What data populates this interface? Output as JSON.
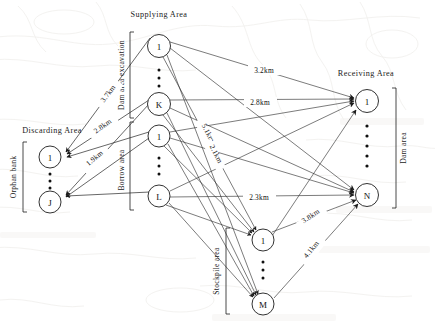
{
  "figure": {
    "type": "network-diagram"
  },
  "groups": {
    "supplying": {
      "title": "Supplying Area",
      "subgroups": [
        {
          "side_label": "Dam area excavation",
          "nodes": [
            "1",
            "K"
          ]
        },
        {
          "side_label": "Borrow area",
          "nodes": [
            "1",
            "L"
          ]
        }
      ]
    },
    "discarding": {
      "title": "Discarding Area",
      "side_label": "Orphan bank",
      "nodes": [
        "1",
        "J"
      ]
    },
    "receiving": {
      "title": "Receiving Area",
      "side_label": "Dam area",
      "nodes": [
        "1",
        "N"
      ]
    },
    "stockpile": {
      "side_label": "Stockpile area",
      "nodes": [
        "1",
        "M"
      ]
    }
  },
  "distances": {
    "unit": "km",
    "edges": [
      {
        "id": "d37",
        "label": "3.7km",
        "from": "supply-dam-1",
        "to": "discard-1"
      },
      {
        "id": "d28l",
        "label": "2.8km",
        "from": "supply-dam-K",
        "to": "discard-1"
      },
      {
        "id": "d19",
        "label": "1.9km",
        "from": "supply-borrow-1",
        "to": "discard-J"
      },
      {
        "id": "d32",
        "label": "3.2km",
        "from": "supply-dam-1",
        "to": "receive-1"
      },
      {
        "id": "d28r",
        "label": "2.8km",
        "from": "supply-dam-K",
        "to": "receive-1"
      },
      {
        "id": "d51",
        "label": "5.1km",
        "from": "supply-dam-1",
        "to": "stockpile-M"
      },
      {
        "id": "d21",
        "label": "2.1km",
        "from": "supply-dam-K",
        "to": "stockpile-1"
      },
      {
        "id": "d23",
        "label": "2.3km",
        "from": "supply-borrow-L",
        "to": "receive-N"
      },
      {
        "id": "d38",
        "label": "3.8km",
        "from": "stockpile-1",
        "to": "receive-N"
      },
      {
        "id": "d41",
        "label": "4.1km",
        "from": "stockpile-M",
        "to": "receive-N"
      }
    ]
  },
  "nodes": {
    "supply_dam_1": "1",
    "supply_dam_K": "K",
    "supply_borrow_1": "1",
    "supply_borrow_L": "L",
    "discard_1": "1",
    "discard_J": "J",
    "receive_1": "1",
    "receive_N": "N",
    "stockpile_1": "1",
    "stockpile_M": "M"
  },
  "colors": {
    "line": "#2b2b2b",
    "node_stroke": "#1c1c1c",
    "node_fill": "#ffffff",
    "text": "#111111",
    "watermark": "#b9b2a6"
  }
}
